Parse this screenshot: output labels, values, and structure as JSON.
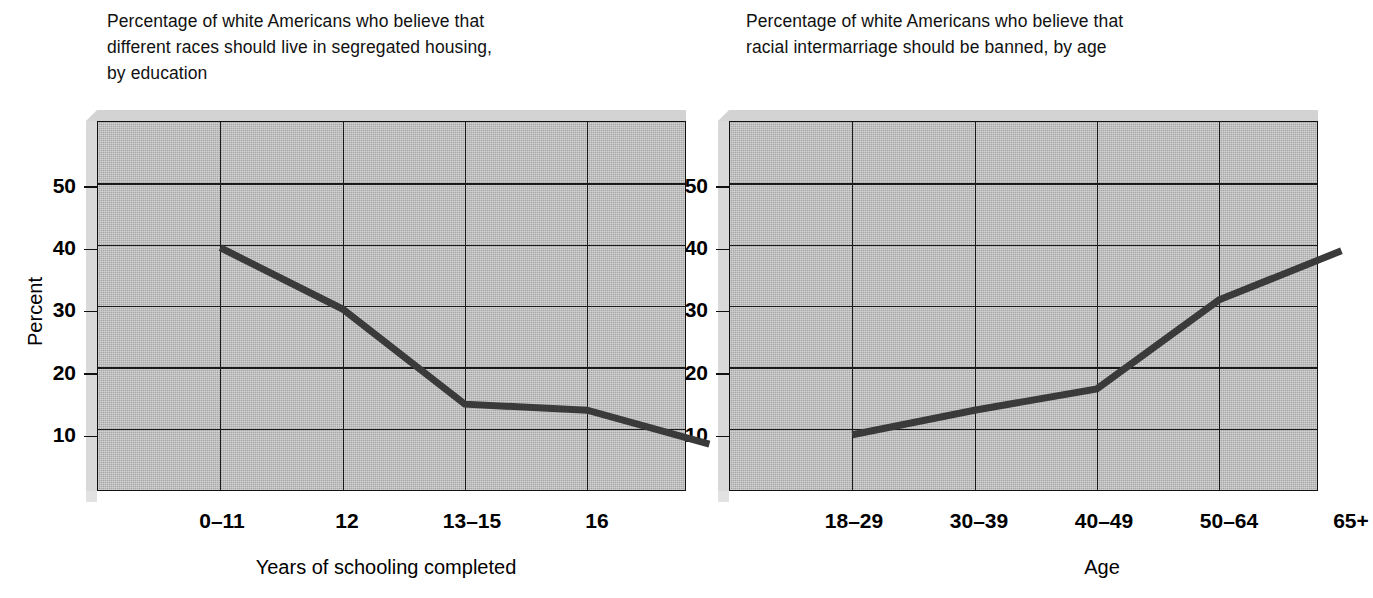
{
  "figure": {
    "background_color": "#ffffff",
    "plot_fill_color": "#a8a8a8",
    "line_color": "#3a3a3a",
    "axis_color": "#111111"
  },
  "panels": [
    {
      "id": "education",
      "title": "Percentage of white Americans who believe that\ndifferent races should live in segregated housing,\nby education",
      "ylabel": "Percent",
      "xlabel": "Years of schooling completed",
      "yticks": [
        "50",
        "40",
        "30",
        "20",
        "10"
      ],
      "xticks": [
        "0–11",
        "12",
        "13–15",
        "16",
        "17–20"
      ]
    },
    {
      "id": "age",
      "title": "Percentage of white Americans who believe that\nracial intermarriage should be banned, by age",
      "ylabel": "Percent",
      "xlabel": "Age",
      "yticks": [
        "50",
        "40",
        "30",
        "20",
        "10"
      ],
      "xticks": [
        "18–29",
        "30–39",
        "40–49",
        "50–64",
        "65+"
      ]
    }
  ],
  "chart_data": [
    {
      "type": "line",
      "title": "Percentage of white Americans who believe that different races should live in segregated housing, by education",
      "xlabel": "Years of schooling completed",
      "ylabel": "Percent",
      "categories": [
        "0–11",
        "12",
        "13–15",
        "16",
        "17–20"
      ],
      "values": [
        39.5,
        29.5,
        14,
        13,
        7.5
      ],
      "ylim": [
        0,
        60
      ],
      "yticks": [
        10,
        20,
        30,
        40,
        50
      ],
      "grid": true,
      "legend": "none",
      "line_color": "#3a3a3a"
    },
    {
      "type": "line",
      "title": "Percentage of white Americans who believe that racial intermarriage should be banned, by age",
      "xlabel": "Age",
      "ylabel": "Percent",
      "categories": [
        "18–29",
        "30–39",
        "40–49",
        "50–64",
        "65+"
      ],
      "values": [
        9,
        13,
        16.5,
        31,
        39
      ],
      "ylim": [
        0,
        60
      ],
      "yticks": [
        10,
        20,
        30,
        40,
        50
      ],
      "grid": true,
      "legend": "none",
      "line_color": "#3a3a3a"
    }
  ]
}
